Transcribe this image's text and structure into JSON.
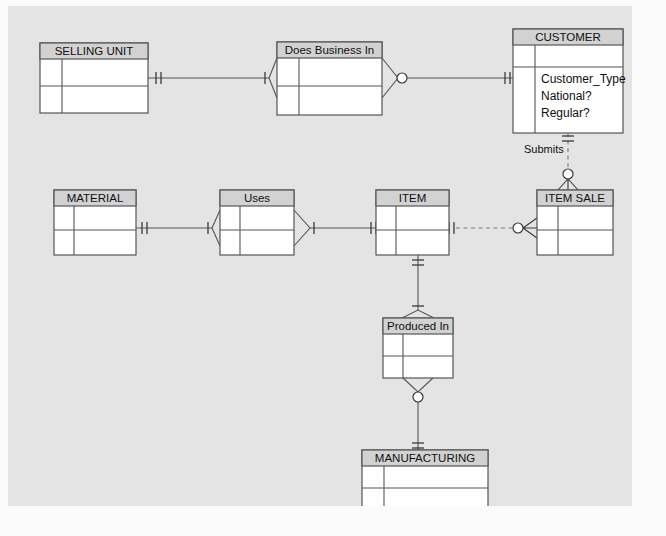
{
  "diagram": {
    "type": "er-diagram",
    "canvas": {
      "background": "#e4e4e4",
      "page_background": "#fbfbfb"
    },
    "colors": {
      "entity_fill": "#ffffff",
      "header_fill": "#d2d2d2",
      "stroke": "#555555",
      "dashed_stroke": "#7b7b7b"
    },
    "entities": [
      {
        "id": "selling_unit",
        "name": "SELLING UNIT",
        "x": 40,
        "y": 43,
        "w": 108,
        "h": 70,
        "attributes": []
      },
      {
        "id": "customer",
        "name": "CUSTOMER",
        "x": 513,
        "y": 29,
        "w": 110,
        "h": 104,
        "attributes": [
          "Customer_Type",
          "National?",
          "Regular?"
        ]
      },
      {
        "id": "material",
        "name": "MATERIAL",
        "x": 53,
        "y": 190,
        "w": 82,
        "h": 65,
        "attributes": []
      },
      {
        "id": "item",
        "name": "ITEM",
        "x": 375,
        "y": 190,
        "w": 72,
        "h": 65,
        "attributes": []
      },
      {
        "id": "item_sale",
        "name": "ITEM SALE",
        "x": 537,
        "y": 190,
        "w": 76,
        "h": 65,
        "attributes": []
      },
      {
        "id": "manufacturing",
        "name": "MANUFACTURING",
        "x": 362,
        "y": 450,
        "w": 126,
        "h": 62,
        "attributes": []
      }
    ],
    "relationships": [
      {
        "id": "does_business_in",
        "name": "Does Business In",
        "x": 277,
        "y": 42,
        "w": 105,
        "h": 73,
        "connects": [
          "selling_unit",
          "customer"
        ]
      },
      {
        "id": "uses",
        "name": "Uses",
        "x": 220,
        "y": 190,
        "w": 73,
        "h": 65,
        "connects": [
          "material",
          "item"
        ]
      },
      {
        "id": "produced_in",
        "name": "Produced In",
        "x": 382,
        "y": 320,
        "w": 70,
        "h": 65,
        "connects": [
          "item",
          "manufacturing"
        ]
      }
    ],
    "connector_labels": [
      {
        "id": "submits",
        "text": "Submits",
        "x": 524,
        "y": 149,
        "connects": [
          "customer",
          "item_sale"
        ],
        "style": "dashed"
      }
    ],
    "cardinality_notation": "crows-foot"
  }
}
